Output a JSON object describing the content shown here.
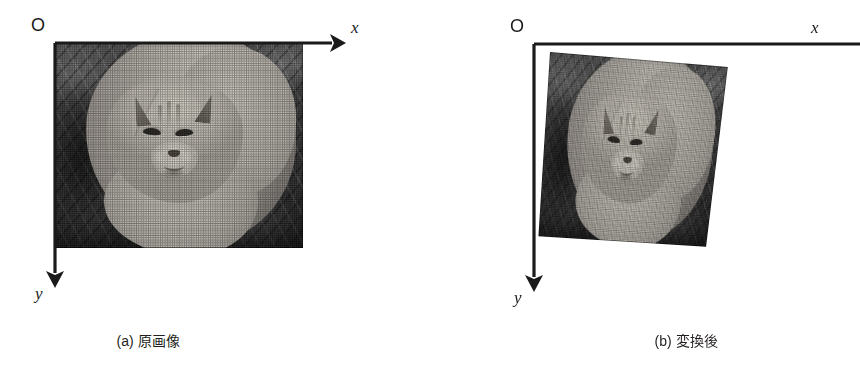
{
  "figure": {
    "background_color": "#ffffff",
    "ink_color": "#1a1a1a",
    "panels": [
      {
        "id": "a",
        "caption": "(a) 原画像",
        "origin_label": "O",
        "x_axis_label": "x",
        "y_axis_label": "y",
        "image_subject": "grayscale photograph of a crouching cat facing the camera on dark undergrowth",
        "image_shape": "rectangle",
        "corners": {
          "top_left": [
            54,
            43
          ],
          "top_right": [
            303,
            43
          ],
          "bottom_right": [
            303,
            248
          ],
          "bottom_left": [
            54,
            248
          ]
        }
      },
      {
        "id": "b",
        "caption": "(b) 変換後",
        "origin_label": "O",
        "x_axis_label": "x",
        "y_axis_label": "y",
        "image_subject": "the same grayscale cat photograph after a projective (perspective) transform",
        "image_shape": "quadrilateral",
        "corners": {
          "top_left": [
            550,
            52
          ],
          "top_right": [
            738,
            68
          ],
          "bottom_right": [
            758,
            222
          ],
          "bottom_left": [
            538,
            252
          ]
        }
      }
    ]
  },
  "icons": {
    "x_axis_arrow": "arrow-right-icon",
    "y_axis_arrow": "arrow-down-icon"
  }
}
